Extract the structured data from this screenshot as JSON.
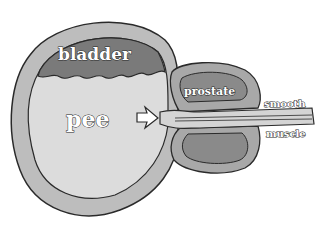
{
  "diagram": {
    "labels": {
      "bladder": "bladder",
      "pee": "pee",
      "prostate": "prostate",
      "smooth": "smooth",
      "muscle": "muscle"
    },
    "colors": {
      "outer_wall": "#bdbdbd",
      "bladder_top": "#7a7a7a",
      "pee_fill": "#dcdcdc",
      "prostate_outer": "#a8a8a8",
      "prostate_inner": "#8a8a8a",
      "urethra": "#d4d4d4",
      "outline": "#2a2a2a"
    },
    "arrow": "flow-arrow-right"
  }
}
